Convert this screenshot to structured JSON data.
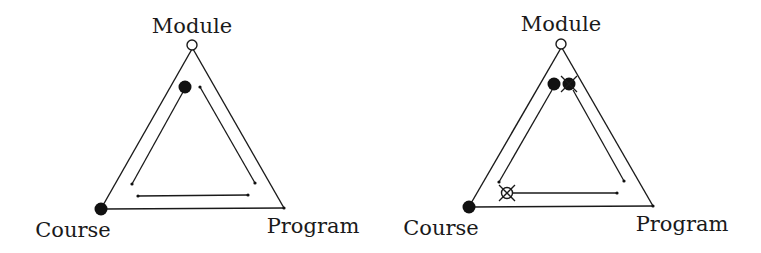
{
  "diagrams": [
    {
      "id": "left",
      "labels": {
        "top": "Module",
        "left": "Course",
        "right": "Program"
      },
      "vertices": {
        "module": {
          "x": 192,
          "y": 45,
          "marker": "hollow-circle"
        },
        "course": {
          "x": 101,
          "y": 209,
          "marker": "filled-circle"
        },
        "program": {
          "x": 284,
          "y": 208,
          "marker": "small-dot"
        }
      },
      "inner_markers": [
        {
          "x": 185,
          "y": 87,
          "marker": "filled-circle"
        }
      ],
      "inner_paths": [
        {
          "from": [
            183,
            92
          ],
          "to": [
            132,
            184
          ]
        },
        {
          "from": [
            200,
            87
          ],
          "to": [
            255,
            183
          ]
        },
        {
          "from": [
            138,
            196
          ],
          "to": [
            248,
            195
          ]
        }
      ]
    },
    {
      "id": "right",
      "labels": {
        "top": "Module",
        "left": "Course",
        "right": "Program"
      },
      "vertices": {
        "module": {
          "x": 561,
          "y": 44,
          "marker": "hollow-circle"
        },
        "course": {
          "x": 469,
          "y": 207,
          "marker": "filled-circle"
        },
        "program": {
          "x": 653,
          "y": 206,
          "marker": "small-dot"
        }
      },
      "inner_markers": [
        {
          "x": 554,
          "y": 84,
          "marker": "filled-circle"
        },
        {
          "x": 569,
          "y": 84,
          "marker": "filled-circle-crossed"
        },
        {
          "x": 507,
          "y": 193,
          "marker": "hollow-circle-crossed"
        }
      ],
      "inner_paths": [
        {
          "from": [
            552,
            90
          ],
          "to": [
            499,
            182
          ]
        },
        {
          "from": [
            573,
            90
          ],
          "to": [
            624,
            181
          ]
        },
        {
          "from": [
            512,
            193
          ],
          "to": [
            617,
            193
          ]
        }
      ]
    }
  ]
}
